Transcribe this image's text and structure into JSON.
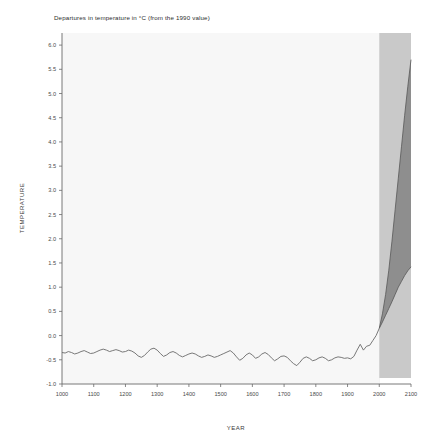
{
  "chart_data": {
    "type": "area",
    "title": "Departures in temperature in °C (from the 1990 value)",
    "xlabel": "YEAR",
    "ylabel": "TEMPERATURE",
    "xlim": [
      1000,
      2100
    ],
    "ylim": [
      -1.0,
      6.25
    ],
    "grid": false,
    "legend": "none",
    "xticks": [
      1000,
      1100,
      1200,
      1300,
      1400,
      1500,
      1600,
      1700,
      1800,
      1900,
      2000,
      2100
    ],
    "xticklabels": [
      "1000",
      "1100",
      "1200",
      "1300",
      "1400",
      "1500",
      "1600",
      "1700",
      "1800",
      "1900",
      "2000",
      "2100"
    ],
    "yticks": [
      -1.0,
      -0.5,
      0.0,
      0.5,
      1.0,
      1.5,
      2.0,
      2.5,
      3.0,
      3.5,
      4.0,
      4.5,
      5.0,
      5.5,
      6.0
    ],
    "yticklabels": [
      "-1.0",
      "-0.5",
      "0.0",
      "0.5",
      "1.0",
      "1.5",
      "2.0",
      "2.5",
      "3.0",
      "3.5",
      "4.0",
      "4.5",
      "5.0",
      "5.5",
      "6.0"
    ],
    "projection_band": {
      "label": "projection-shading",
      "x_start": 2000,
      "x_end": 2100,
      "color": "#c9c9c9"
    },
    "series": [
      {
        "name": "Reconstructed and observed temperature",
        "type": "line",
        "color": "#6a6a6a",
        "x": [
          1000,
          1010,
          1020,
          1030,
          1040,
          1050,
          1060,
          1070,
          1080,
          1090,
          1100,
          1110,
          1120,
          1130,
          1140,
          1150,
          1160,
          1170,
          1180,
          1190,
          1200,
          1210,
          1220,
          1230,
          1240,
          1250,
          1260,
          1270,
          1280,
          1290,
          1300,
          1310,
          1320,
          1330,
          1340,
          1350,
          1360,
          1370,
          1380,
          1390,
          1400,
          1410,
          1420,
          1430,
          1440,
          1450,
          1460,
          1470,
          1480,
          1490,
          1500,
          1510,
          1520,
          1530,
          1540,
          1550,
          1560,
          1570,
          1580,
          1590,
          1600,
          1610,
          1620,
          1630,
          1640,
          1650,
          1660,
          1670,
          1680,
          1690,
          1700,
          1710,
          1720,
          1730,
          1740,
          1750,
          1760,
          1770,
          1780,
          1790,
          1800,
          1810,
          1820,
          1830,
          1840,
          1850,
          1860,
          1870,
          1880,
          1890,
          1900,
          1910,
          1920,
          1930,
          1940,
          1950,
          1960,
          1970,
          1980,
          1990,
          2000
        ],
        "values": [
          -0.35,
          -0.36,
          -0.33,
          -0.35,
          -0.38,
          -0.36,
          -0.33,
          -0.31,
          -0.34,
          -0.37,
          -0.36,
          -0.33,
          -0.3,
          -0.28,
          -0.3,
          -0.33,
          -0.31,
          -0.29,
          -0.31,
          -0.34,
          -0.33,
          -0.3,
          -0.32,
          -0.36,
          -0.42,
          -0.45,
          -0.41,
          -0.34,
          -0.28,
          -0.26,
          -0.3,
          -0.37,
          -0.43,
          -0.4,
          -0.35,
          -0.33,
          -0.36,
          -0.41,
          -0.44,
          -0.41,
          -0.38,
          -0.36,
          -0.38,
          -0.42,
          -0.45,
          -0.43,
          -0.4,
          -0.42,
          -0.45,
          -0.43,
          -0.4,
          -0.37,
          -0.34,
          -0.31,
          -0.36,
          -0.44,
          -0.51,
          -0.47,
          -0.4,
          -0.36,
          -0.4,
          -0.47,
          -0.44,
          -0.38,
          -0.35,
          -0.39,
          -0.46,
          -0.52,
          -0.48,
          -0.43,
          -0.42,
          -0.45,
          -0.52,
          -0.58,
          -0.62,
          -0.55,
          -0.47,
          -0.44,
          -0.47,
          -0.52,
          -0.5,
          -0.46,
          -0.44,
          -0.47,
          -0.52,
          -0.5,
          -0.46,
          -0.44,
          -0.45,
          -0.47,
          -0.46,
          -0.48,
          -0.43,
          -0.3,
          -0.18,
          -0.3,
          -0.22,
          -0.2,
          -0.1,
          0.0,
          0.15
        ]
      },
      {
        "name": "Projection upper bound",
        "type": "line",
        "color": "#585858",
        "x": [
          2000,
          2010,
          2020,
          2030,
          2040,
          2050,
          2060,
          2070,
          2080,
          2090,
          2100
        ],
        "values": [
          0.15,
          0.45,
          0.85,
          1.35,
          1.95,
          2.6,
          3.25,
          3.9,
          4.55,
          5.15,
          5.7
        ]
      },
      {
        "name": "Projection lower bound",
        "type": "line",
        "color": "#585858",
        "x": [
          2000,
          2010,
          2020,
          2030,
          2040,
          2050,
          2060,
          2070,
          2080,
          2090,
          2100
        ],
        "values": [
          0.15,
          0.28,
          0.42,
          0.56,
          0.7,
          0.85,
          1.0,
          1.12,
          1.24,
          1.34,
          1.42
        ]
      }
    ],
    "projection_fill_color": "#8e8e8e",
    "background_color": "#f7f7f7"
  },
  "colors": {
    "plot_background": "#f7f7f7",
    "band": "#c9c9c9",
    "cone_fill": "#8e8e8e",
    "line": "#6a6a6a",
    "axis": "#6a6a6a",
    "text": "#3a3a3a"
  }
}
